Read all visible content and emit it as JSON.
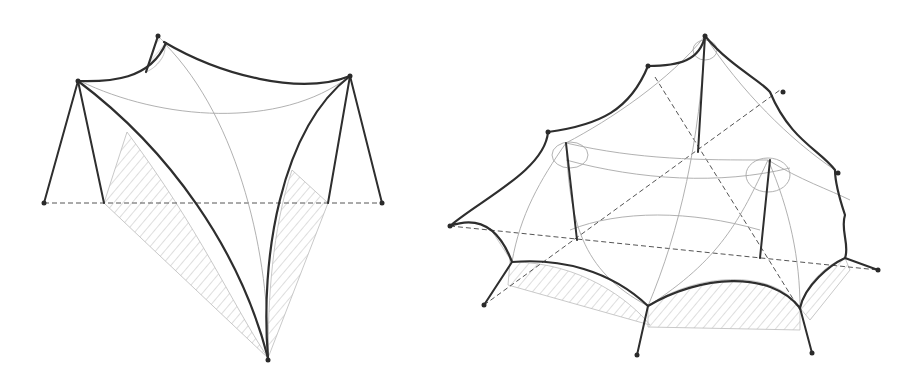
{
  "figure": {
    "colors": {
      "background": "#ffffff",
      "edge_cable": "#2e2e2e",
      "membrane_lines": "#a8a8a8",
      "ground_dashed": "#555555",
      "hatch": "#b8b8b8"
    },
    "structures": [
      {
        "id": "left",
        "type": "four-point hypar-like tensile sail with two masts",
        "mast_count": 2,
        "anchor_count": 3
      },
      {
        "id": "right",
        "type": "multi-mast tensile canopy with central peak",
        "mast_count": 3,
        "anchor_count": 10
      }
    ]
  }
}
